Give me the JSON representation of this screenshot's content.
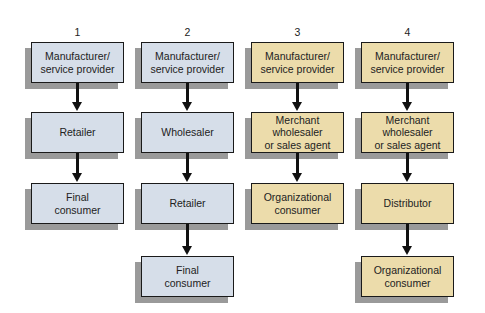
{
  "diagram": {
    "type": "flowchart",
    "colors": {
      "consumer_channel_fill": "#d6dee9",
      "organizational_channel_fill": "#ecdcab",
      "border": "#1a1a1a",
      "shadow": "#9a9a9a"
    },
    "columns": [
      {
        "number": "1",
        "theme": "blue",
        "nodes": [
          {
            "label": "Manufacturer/\nservice provider"
          },
          {
            "label": "Retailer"
          },
          {
            "label": "Final\nconsumer"
          }
        ]
      },
      {
        "number": "2",
        "theme": "blue",
        "nodes": [
          {
            "label": "Manufacturer/\nservice provider"
          },
          {
            "label": "Wholesaler"
          },
          {
            "label": "Retailer"
          },
          {
            "label": "Final\nconsumer"
          }
        ]
      },
      {
        "number": "3",
        "theme": "tan",
        "nodes": [
          {
            "label": "Manufacturer/\nservice provider"
          },
          {
            "label": "Merchant\nwholesaler\nor sales agent"
          },
          {
            "label": "Organizational\nconsumer"
          }
        ]
      },
      {
        "number": "4",
        "theme": "tan",
        "nodes": [
          {
            "label": "Manufacturer/\nservice provider"
          },
          {
            "label": "Merchant\nwholesaler\nor sales agent"
          },
          {
            "label": "Distributor"
          },
          {
            "label": "Organizational\nconsumer"
          }
        ]
      }
    ],
    "edges": [
      {
        "column": "1",
        "from": "Manufacturer/service provider",
        "to": "Retailer"
      },
      {
        "column": "1",
        "from": "Retailer",
        "to": "Final consumer"
      },
      {
        "column": "2",
        "from": "Manufacturer/service provider",
        "to": "Wholesaler"
      },
      {
        "column": "2",
        "from": "Wholesaler",
        "to": "Retailer"
      },
      {
        "column": "2",
        "from": "Retailer",
        "to": "Final consumer"
      },
      {
        "column": "3",
        "from": "Manufacturer/service provider",
        "to": "Merchant wholesaler or sales agent"
      },
      {
        "column": "3",
        "from": "Merchant wholesaler or sales agent",
        "to": "Organizational consumer"
      },
      {
        "column": "4",
        "from": "Manufacturer/service provider",
        "to": "Merchant wholesaler or sales agent"
      },
      {
        "column": "4",
        "from": "Merchant wholesaler or sales agent",
        "to": "Distributor"
      },
      {
        "column": "4",
        "from": "Distributor",
        "to": "Organizational consumer"
      }
    ]
  }
}
